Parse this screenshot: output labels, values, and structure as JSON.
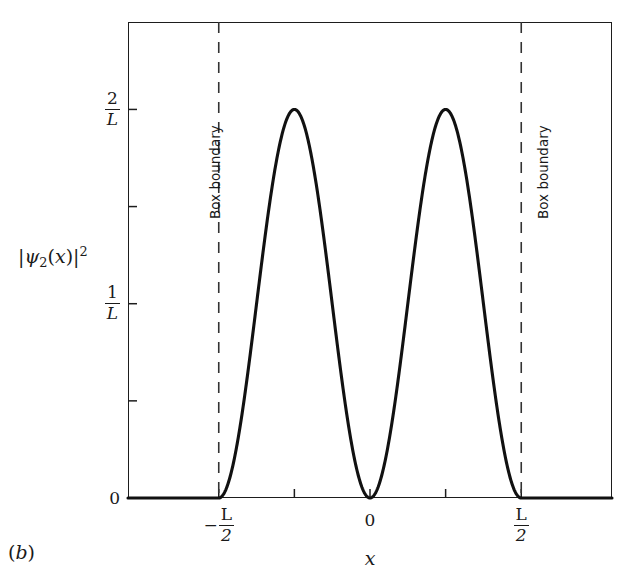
{
  "figure": {
    "panel_label": "(b)",
    "panel_label_text": "b"
  },
  "axes": {
    "ylabel": {
      "full": "|ψ₂(x)|²",
      "psi": "ψ",
      "subscript": "2",
      "variable": "x",
      "exponent": "2",
      "bar": "|"
    },
    "xlabel": "x",
    "y_ticks": [
      {
        "value": 2,
        "label_num": "2",
        "label_den": "L",
        "labeled": true
      },
      {
        "value": 1.5,
        "label_num": "",
        "label_den": "",
        "labeled": false
      },
      {
        "value": 1,
        "label_num": "1",
        "label_den": "L",
        "labeled": true
      },
      {
        "value": 0.5,
        "label_num": "",
        "label_den": "",
        "labeled": false
      },
      {
        "value": 0,
        "label_num": "0",
        "label_den": "",
        "labeled": true
      }
    ],
    "x_ticks": [
      {
        "value": -0.5,
        "sign": "−",
        "label_num": "L",
        "label_den": "2",
        "labeled": true
      },
      {
        "value": -0.25,
        "sign": "",
        "label_num": "",
        "label_den": "",
        "labeled": false
      },
      {
        "value": 0,
        "sign": "",
        "label_num": "0",
        "label_den": "",
        "labeled": true
      },
      {
        "value": 0.25,
        "sign": "",
        "label_num": "",
        "label_den": "",
        "labeled": false
      },
      {
        "value": 0.5,
        "sign": "",
        "label_num": "L",
        "label_den": "2",
        "labeled": true
      }
    ],
    "zero_label": "0"
  },
  "annotations": {
    "left_boundary": "Box boundary",
    "right_boundary": "Box boundary"
  },
  "colors": {
    "curve": "#111111",
    "frame": "#1d1d1d",
    "dashed": "#333333",
    "text": "#1a1a1a",
    "background": "#ffffff"
  },
  "chart_data": {
    "type": "line",
    "title": "",
    "subtitle": "",
    "xlabel": "x",
    "ylabel": "|ψ₂(x)|²",
    "xlim": [
      -0.8,
      0.8
    ],
    "ylim": [
      0,
      2.45
    ],
    "x_tick_labels": [
      "-L/2",
      "",
      "0",
      "",
      "L/2"
    ],
    "x_tick_values": [
      -0.5,
      -0.25,
      0,
      0.25,
      0.5
    ],
    "y_tick_labels": [
      "0",
      "",
      "1/L",
      "",
      "2/L"
    ],
    "y_tick_values": [
      0,
      0.5,
      1,
      1.5,
      2
    ],
    "grid": false,
    "legend": null,
    "formula": "(2/L) * sin^2(2*pi*(x + L/2)/L) for |x| <= L/2, else 0",
    "peaks": [
      {
        "x": -0.25,
        "y": 2
      },
      {
        "x": 0.25,
        "y": 2
      }
    ],
    "nodes": [
      {
        "x": -0.5,
        "y": 0
      },
      {
        "x": 0,
        "y": 0
      },
      {
        "x": 0.5,
        "y": 0
      }
    ],
    "series": [
      {
        "name": "|psi_2(x)|^2",
        "x": [
          -0.8,
          -0.7,
          -0.6,
          -0.5,
          -0.48,
          -0.46,
          -0.44,
          -0.42,
          -0.4,
          -0.38,
          -0.36,
          -0.34,
          -0.32,
          -0.3,
          -0.28,
          -0.26,
          -0.25,
          -0.24,
          -0.22,
          -0.2,
          -0.18,
          -0.16,
          -0.14,
          -0.12,
          -0.1,
          -0.08,
          -0.06,
          -0.04,
          -0.02,
          0,
          0.02,
          0.04,
          0.06,
          0.08,
          0.1,
          0.12,
          0.14,
          0.16,
          0.18,
          0.2,
          0.22,
          0.24,
          0.25,
          0.26,
          0.28,
          0.3,
          0.32,
          0.34,
          0.36,
          0.38,
          0.4,
          0.42,
          0.44,
          0.46,
          0.48,
          0.5,
          0.6,
          0.7,
          0.8
        ],
        "y": [
          0,
          0,
          0,
          0,
          0.031,
          0.122,
          0.27,
          0.466,
          0.691,
          0.933,
          1.175,
          1.4,
          1.596,
          1.746,
          1.847,
          1.92,
          2.0,
          1.981,
          1.938,
          1.809,
          1.656,
          1.454,
          1.222,
          0.979,
          0.727,
          0.483,
          0.27,
          0.122,
          0.031,
          0,
          0.031,
          0.122,
          0.27,
          0.483,
          0.727,
          0.979,
          1.222,
          1.454,
          1.656,
          1.809,
          1.938,
          1.981,
          2.0,
          1.981,
          1.92,
          1.847,
          1.746,
          1.596,
          1.4,
          1.175,
          0.933,
          0.691,
          0.466,
          0.27,
          0.031,
          0,
          0,
          0,
          0
        ]
      }
    ],
    "vertical_lines": [
      {
        "x": -0.5,
        "style": "dashed",
        "label": "Box boundary"
      },
      {
        "x": 0.5,
        "style": "dashed",
        "label": "Box boundary"
      }
    ]
  }
}
